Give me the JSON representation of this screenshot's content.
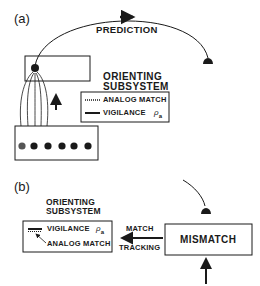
{
  "panel_a": {
    "label": "(a)",
    "prediction_label": "PREDICTION",
    "orienting_title_line1": "ORIENTING",
    "orienting_title_line2": "SUBSYSTEM",
    "legend": {
      "analog_match": "ANALOG MATCH",
      "vigilance": "VIGILANCE",
      "rho": "ρ",
      "rho_sub": "a"
    },
    "input_nodes_count": 6
  },
  "panel_b": {
    "label": "(b)",
    "orienting_title_line1": "ORIENTING",
    "orienting_title_line2": "SUBSYSTEM",
    "vigilance": "VIGILANCE",
    "rho": "ρ",
    "rho_sub": "a",
    "analog_match": "ANALOG MATCH",
    "match_label": "MATCH",
    "tracking_label": "TRACKING",
    "mismatch_label": "MISMATCH"
  },
  "colors": {
    "ink": "#1a1a1a",
    "background": "#ffffff"
  }
}
